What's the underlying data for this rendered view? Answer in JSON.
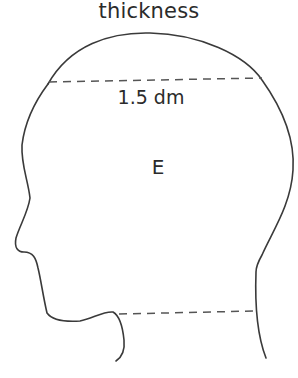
{
  "diagram": {
    "title": "thickness",
    "measurement_label": "1.5 dm",
    "region_label": "E",
    "stroke_color": "#3a3a3a",
    "dash_color": "#555555",
    "shape": "head-profile-outline"
  }
}
